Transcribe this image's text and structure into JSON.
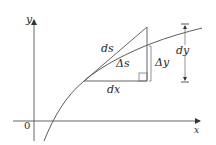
{
  "diagram": {
    "axes": {
      "x_label": "x",
      "y_label": "y",
      "origin_label": "0"
    },
    "labels": {
      "ds": "ds",
      "delta_s": "Δs",
      "dx": "dx",
      "delta_y": "Δy",
      "dy": "dy"
    },
    "colors": {
      "line": "#3a3a3a",
      "curve": "#4a4a4a",
      "background": "#ffffff"
    }
  }
}
